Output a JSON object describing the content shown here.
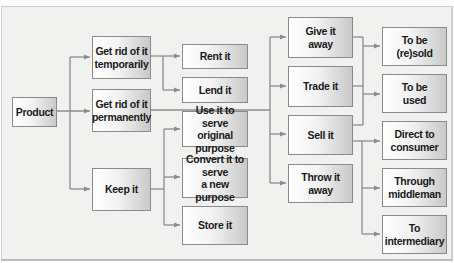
{
  "diagram": {
    "root": {
      "label": "Product"
    },
    "level1": [
      {
        "id": "temp",
        "label": "Get rid of it\ntemporarily"
      },
      {
        "id": "perm",
        "label": "Get rid of it\npermanently"
      },
      {
        "id": "keep",
        "label": "Keep it"
      }
    ],
    "temporary_options": [
      {
        "label": "Rent it"
      },
      {
        "label": "Lend it"
      }
    ],
    "keep_options": [
      {
        "label": "Use it to serve\noriginal purpose"
      },
      {
        "label": "Convert it to serve\na new purpose"
      },
      {
        "label": "Store it"
      }
    ],
    "permanent_options": [
      {
        "label": "Give it\naway"
      },
      {
        "label": "Trade it"
      },
      {
        "label": "Sell it"
      },
      {
        "label": "Throw it\naway"
      }
    ],
    "destinations": [
      {
        "label": "To be\n(re)sold"
      },
      {
        "label": "To be\nused"
      }
    ],
    "sell_channels": [
      {
        "label": "Direct to\nconsumer"
      },
      {
        "label": "Through\nmiddleman"
      },
      {
        "label": "To\nintermediary"
      }
    ],
    "colors": {
      "background": "#f1f1f0",
      "connector": "#8c8c8c",
      "box_border": "#8a8a8a",
      "box_shade": "#c9c9c9"
    }
  }
}
